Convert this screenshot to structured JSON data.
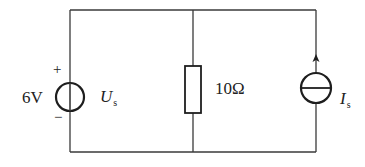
{
  "diagram": {
    "type": "circuit",
    "colors": {
      "wire": "#3a3a3a",
      "component": "#1e1e1e",
      "background": "#ffffff"
    },
    "voltage_source": {
      "value_label": "6V",
      "symbol_main": "U",
      "symbol_sub": "s",
      "plus_label": "+",
      "minus_label": "−"
    },
    "resistor": {
      "value_label": "10Ω"
    },
    "current_source": {
      "symbol_main": "I",
      "symbol_sub": "s",
      "direction": "up"
    }
  }
}
